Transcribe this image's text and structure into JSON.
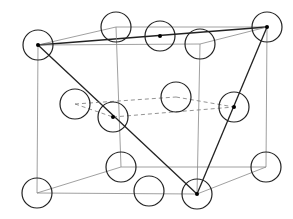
{
  "diagram": {
    "colors": {
      "line": "#444444",
      "atom_stroke": "#222222",
      "atom_fill": "#ffffff",
      "background": "#ffffff"
    },
    "atom_radius": 15,
    "atoms": [
      {
        "id": "A",
        "x": 38,
        "y": 45,
        "center_dot": true
      },
      {
        "id": "B",
        "x": 116,
        "y": 27,
        "center_dot": false
      },
      {
        "id": "C",
        "x": 160,
        "y": 36,
        "center_dot": true
      },
      {
        "id": "D",
        "x": 200,
        "y": 44,
        "center_dot": false
      },
      {
        "id": "E",
        "x": 267,
        "y": 27,
        "center_dot": true
      },
      {
        "id": "F",
        "x": 75,
        "y": 104,
        "center_dot": false
      },
      {
        "id": "G",
        "x": 113,
        "y": 117,
        "center_dot": true
      },
      {
        "id": "H",
        "x": 176,
        "y": 97,
        "center_dot": false
      },
      {
        "id": "I",
        "x": 234,
        "y": 107,
        "center_dot": true
      },
      {
        "id": "J",
        "x": 121,
        "y": 167,
        "center_dot": false
      },
      {
        "id": "K",
        "x": 266,
        "y": 167,
        "center_dot": false
      },
      {
        "id": "L",
        "x": 37,
        "y": 193,
        "center_dot": false
      },
      {
        "id": "M",
        "x": 149,
        "y": 191,
        "center_dot": false
      },
      {
        "id": "N",
        "x": 197,
        "y": 194,
        "center_dot": true
      }
    ],
    "bonds": [
      {
        "from": "A",
        "to": "B",
        "style": "thin"
      },
      {
        "from": "B",
        "to": "E",
        "style": "thin"
      },
      {
        "from": "A",
        "to": "E",
        "style": "bold"
      },
      {
        "from": "A",
        "to": "D",
        "style": "thin"
      },
      {
        "from": "D",
        "to": "E",
        "style": "thin"
      },
      {
        "from": "A",
        "to": "L",
        "style": "thin"
      },
      {
        "from": "B",
        "to": "J",
        "style": "thin"
      },
      {
        "from": "D",
        "to": "N",
        "style": "thin"
      },
      {
        "from": "E",
        "to": "K",
        "style": "thin"
      },
      {
        "from": "L",
        "to": "J",
        "style": "thin"
      },
      {
        "from": "J",
        "to": "K",
        "style": "thin"
      },
      {
        "from": "L",
        "to": "N",
        "style": "thin"
      },
      {
        "from": "N",
        "to": "K",
        "style": "thin"
      },
      {
        "from": "A",
        "to": "N",
        "style": "bold"
      },
      {
        "from": "E",
        "to": "N",
        "style": "bold"
      },
      {
        "from": "F",
        "to": "G",
        "style": "dashed"
      },
      {
        "from": "F",
        "to": "H",
        "style": "dashed"
      },
      {
        "from": "H",
        "to": "I",
        "style": "dashed"
      },
      {
        "from": "G",
        "to": "I",
        "style": "dashed"
      }
    ]
  }
}
